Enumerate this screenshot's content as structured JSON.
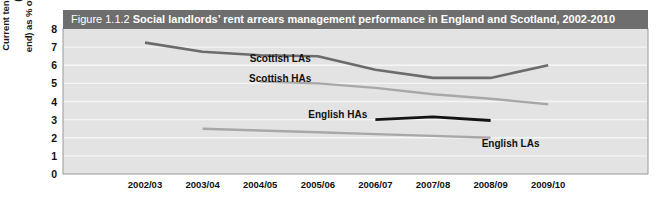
{
  "figure": {
    "number_label": "Figure 1.1.2",
    "title": "Social landlords’ rent arrears management performance in England and Scotland, 2002-2010",
    "title_bar_color": "#6e6e6e",
    "plot_background_color": "#e3e3e3",
    "gridline_color": "#f5f5f5",
    "border_color": "#9a9a9a"
  },
  "chart_data": {
    "type": "line",
    "title": "Social landlords’ rent arrears management performance in England and Scotland, 2002-2010",
    "xlabel": "",
    "ylabel": "Current tenants rent arrears (year-end) as % of rent due in year",
    "ylabel_line1": "Current tenants rent arrears (year-",
    "ylabel_line2": "end) as % of rent due in year",
    "categories": [
      "2002/03",
      "2003/04",
      "2004/05",
      "2005/06",
      "2006/07",
      "2007/08",
      "2008/09",
      "2009/10"
    ],
    "ylim": [
      0,
      8
    ],
    "yticks": [
      0,
      1,
      2,
      3,
      4,
      5,
      6,
      7,
      8
    ],
    "grid": true,
    "legend": "inline-labels",
    "series": [
      {
        "name": "Scottish LAs",
        "color": "#6b6b6b",
        "width": 2.6,
        "label_x": "2004/05",
        "label_value": 6.35,
        "x": [
          "2002/03",
          "2003/04",
          "2004/05",
          "2005/06",
          "2006/07",
          "2007/08",
          "2008/09",
          "2009/10"
        ],
        "values": [
          7.25,
          6.75,
          6.55,
          6.5,
          5.75,
          5.3,
          5.3,
          6.0
        ]
      },
      {
        "name": "Scottish HAs",
        "color": "#a8a8a8",
        "width": 2.4,
        "label_x": "2004/05",
        "label_value": 5.25,
        "x": [
          "2004/05",
          "2005/06",
          "2006/07",
          "2007/08",
          "2008/09",
          "2009/10"
        ],
        "values": [
          5.1,
          5.0,
          4.75,
          4.4,
          4.15,
          3.85
        ]
      },
      {
        "name": "English HAs",
        "color": "#141414",
        "width": 2.8,
        "label_x": "2005/06",
        "label_value": 3.25,
        "x": [
          "2006/07",
          "2007/08",
          "2008/09"
        ],
        "values": [
          3.0,
          3.15,
          2.95
        ]
      },
      {
        "name": "English LAs",
        "color": "#a8a8a8",
        "width": 2.4,
        "label_x": "2008/09",
        "label_value": 1.65,
        "x": [
          "2003/04",
          "2004/05",
          "2005/06",
          "2006/07",
          "2007/08",
          "2008/09"
        ],
        "values": [
          2.5,
          2.4,
          2.3,
          2.2,
          2.1,
          2.0
        ]
      }
    ]
  }
}
